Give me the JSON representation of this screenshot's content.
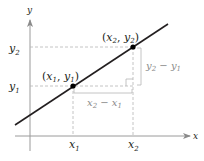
{
  "diagram": {
    "type": "slope-of-line-coordinate-diagram",
    "axes": {
      "x_label": "x",
      "y_label": "y"
    },
    "points": [
      {
        "name": "point-1",
        "label_open": "(",
        "x_var": "x",
        "x_sub": "1",
        "sep": ", ",
        "y_var": "y",
        "y_sub": "1",
        "label_close": ")"
      },
      {
        "name": "point-2",
        "label_open": "(",
        "x_var": "x",
        "x_sub": "2",
        "sep": ", ",
        "y_var": "y",
        "y_sub": "2",
        "label_close": ")"
      }
    ],
    "tick_labels": {
      "x1": {
        "var": "x",
        "sub": "1"
      },
      "x2": {
        "var": "x",
        "sub": "2"
      },
      "y1": {
        "var": "y",
        "sub": "1"
      },
      "y2": {
        "var": "y",
        "sub": "2"
      }
    },
    "run_label": {
      "a_var": "x",
      "a_sub": "2",
      "op": " − ",
      "b_var": "x",
      "b_sub": "1"
    },
    "rise_label": {
      "a_var": "y",
      "a_sub": "2",
      "op": " − ",
      "b_var": "y",
      "b_sub": "1"
    },
    "colors": {
      "line": "#231f20",
      "axis": "#9a9a9a",
      "guide": "#b5b5b5",
      "point": "#000000",
      "text": "#231f20",
      "secondary_text": "#8a8a8a"
    }
  }
}
